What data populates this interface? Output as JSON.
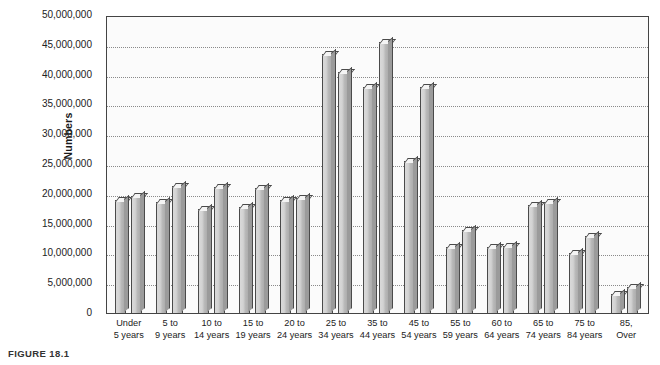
{
  "caption": "FIGURE 18.1",
  "chart_data": {
    "type": "bar",
    "title": "",
    "xlabel": "",
    "ylabel": "Numbers",
    "ylim": [
      0,
      50000000
    ],
    "ytick_step": 5000000,
    "grid": true,
    "legend": "none",
    "categories": [
      "Under\n5 years",
      "5 to\n9 years",
      "10 to\n14 years",
      "15 to\n19 years",
      "20 to\n24 years",
      "25 to\n34 years",
      "35 to\n44 years",
      "45 to\n54 years",
      "55 to\n59 years",
      "60 to\n64 years",
      "65 to\n74 years",
      "75 to\n84 years",
      "85,\nOver"
    ],
    "ytick_labels": [
      "50,000,000",
      "45,000,000",
      "40,000,000",
      "35,000,000",
      "30,000,000",
      "25,000,000",
      "20,000,000",
      "15,000,000",
      "10,000,000",
      "5,000,000",
      "0"
    ],
    "ytick_values": [
      50000000,
      45000000,
      40000000,
      35000000,
      30000000,
      25000000,
      20000000,
      15000000,
      10000000,
      5000000,
      0
    ],
    "series": [
      {
        "name": "Series 1",
        "values": [
          19000000,
          18700000,
          17500000,
          17800000,
          19000000,
          43500000,
          38000000,
          25500000,
          11000000,
          11000000,
          18200000,
          10000000,
          3200000
        ]
      },
      {
        "name": "Series 2",
        "values": [
          19600000,
          21300000,
          21200000,
          20900000,
          19300000,
          40500000,
          45500000,
          38000000,
          13900000,
          11300000,
          18700000,
          13000000,
          4300000
        ]
      }
    ]
  },
  "colors": {
    "bar_face": "#c9c9c9",
    "bar_edge": "#4a4a4a",
    "bar_top": "#f4f4f4",
    "bar_side": "#9b9b9b",
    "plot_background": "#fbfbfb",
    "gridline": "#8a8a8a",
    "axis": "#444444",
    "text": "#222222"
  }
}
